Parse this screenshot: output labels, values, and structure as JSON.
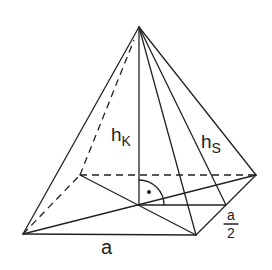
{
  "diagram": {
    "labels": {
      "body_height": "h",
      "body_height_sub": "K",
      "slant_height": "h",
      "slant_height_sub": "S",
      "base_edge": "a",
      "half_edge_num": "a",
      "half_edge_den": "2"
    },
    "right_angle_marker": "·",
    "colors": {
      "line": "#222222",
      "background": "#ffffff"
    }
  }
}
